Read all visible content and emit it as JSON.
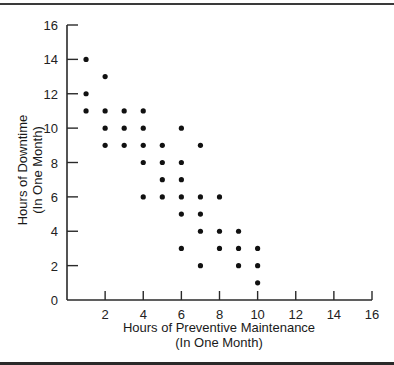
{
  "chart_data": {
    "type": "scatter",
    "title": "",
    "xlabel": "Hours of Preventive Maintenance",
    "xlabel_sub": "(In One Month)",
    "ylabel": "Hours of Downtime",
    "ylabel_sub": "(In One Month)",
    "xlim": [
      0,
      16
    ],
    "ylim": [
      0,
      16
    ],
    "x_ticks": [
      2,
      4,
      6,
      8,
      10,
      12,
      14,
      16
    ],
    "y_ticks": [
      0,
      2,
      4,
      6,
      8,
      10,
      12,
      14,
      16
    ],
    "grid": false,
    "legend": null,
    "marker_color": "#111111",
    "points": [
      [
        1,
        14
      ],
      [
        2,
        13
      ],
      [
        1,
        12
      ],
      [
        1,
        11
      ],
      [
        2,
        11
      ],
      [
        3,
        11
      ],
      [
        4,
        11
      ],
      [
        2,
        10
      ],
      [
        3,
        10
      ],
      [
        4,
        10
      ],
      [
        6,
        10
      ],
      [
        2,
        9
      ],
      [
        3,
        9
      ],
      [
        4,
        9
      ],
      [
        5,
        9
      ],
      [
        7,
        9
      ],
      [
        4,
        8
      ],
      [
        5,
        8
      ],
      [
        6,
        8
      ],
      [
        5,
        7
      ],
      [
        6,
        7
      ],
      [
        4,
        6
      ],
      [
        5,
        6
      ],
      [
        6,
        6
      ],
      [
        7,
        6
      ],
      [
        8,
        6
      ],
      [
        6,
        5
      ],
      [
        7,
        5
      ],
      [
        7,
        4
      ],
      [
        8,
        4
      ],
      [
        9,
        4
      ],
      [
        6,
        3
      ],
      [
        8,
        3
      ],
      [
        9,
        3
      ],
      [
        10,
        3
      ],
      [
        7,
        2
      ],
      [
        9,
        2
      ],
      [
        10,
        2
      ],
      [
        10,
        1
      ]
    ]
  }
}
